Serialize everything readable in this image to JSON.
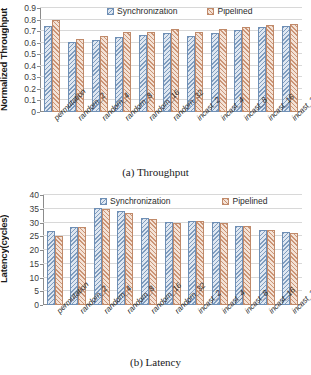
{
  "chart_data": [
    {
      "type": "bar",
      "title": "(a) Throughput",
      "xlabel": "",
      "ylabel": "Normalized Throughput",
      "ylim": [
        0,
        0.9
      ],
      "yticks": [
        "0",
        "0.1",
        "0.2",
        "0.3",
        "0.4",
        "0.5",
        "0.6",
        "0.7",
        "0.8",
        "0.9"
      ],
      "grid": false,
      "legend_position": "top-center",
      "categories": [
        "permutation",
        "random_2",
        "random_4",
        "random_8",
        "random_16",
        "random_32",
        "incast_2",
        "incast_4",
        "incast_8",
        "incast_16",
        "incast_32"
      ],
      "series": [
        {
          "name": "Synchronization",
          "color": "#dfe7f1",
          "values": [
            0.745,
            0.61,
            0.625,
            0.65,
            0.67,
            0.68,
            0.66,
            0.68,
            0.71,
            0.735,
            0.745
          ]
        },
        {
          "name": "Pipelined",
          "color": "#f3e2d6",
          "values": [
            0.8,
            0.635,
            0.655,
            0.69,
            0.69,
            0.72,
            0.69,
            0.72,
            0.735,
            0.755,
            0.76
          ]
        }
      ]
    },
    {
      "type": "bar",
      "title": "(b) Latency",
      "xlabel": "",
      "ylabel": "Latency(cycles)",
      "ylim": [
        0,
        40
      ],
      "yticks": [
        "0",
        "5",
        "10",
        "15",
        "20",
        "25",
        "30",
        "35",
        "40"
      ],
      "grid": false,
      "legend_position": "top-center",
      "categories": [
        "permutation",
        "random_2",
        "random_4",
        "random_8",
        "random_16",
        "random_32",
        "incast_2",
        "incast_4",
        "incast_8",
        "incast_16",
        "incast_32"
      ],
      "series": [
        {
          "name": "Synchronization",
          "color": "#dfe7f1",
          "values": [
            27.0,
            28.5,
            35.3,
            34.1,
            31.5,
            30.3,
            30.7,
            30.2,
            28.7,
            27.4,
            26.5
          ]
        },
        {
          "name": "Pipelined",
          "color": "#f3e2d6",
          "values": [
            25.2,
            28.5,
            34.8,
            33.6,
            31.2,
            29.9,
            30.5,
            29.9,
            28.7,
            27.4,
            26.3
          ]
        }
      ]
    }
  ],
  "panel_a": {
    "ytitle": "Normalized Throughput",
    "caption": "(a) Throughput",
    "legend": [
      "Synchronization",
      "Pipelined"
    ]
  },
  "panel_b": {
    "ytitle": "Latency(cycles)",
    "caption": "(b) Latency",
    "legend": [
      "Synchronization",
      "Pipelined"
    ]
  }
}
